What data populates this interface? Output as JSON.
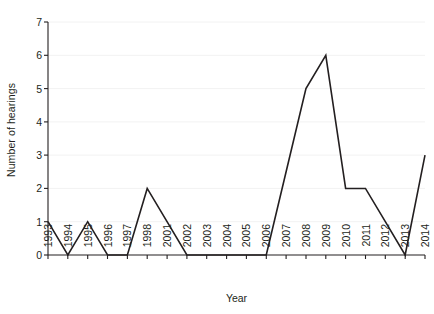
{
  "chart_data": {
    "type": "line",
    "title": "",
    "xlabel": "Year",
    "ylabel": "Number of hearings",
    "categories": [
      "1993",
      "1994",
      "1995",
      "1996",
      "1997",
      "1998",
      "2001",
      "2002",
      "2003",
      "2004",
      "2005",
      "2006",
      "2007",
      "2008",
      "2009",
      "2010",
      "2011",
      "2012",
      "2013",
      "2014"
    ],
    "values": [
      1,
      0,
      1,
      0,
      0,
      2,
      1,
      0,
      0,
      0,
      0,
      0,
      2.5,
      5,
      6,
      2,
      2,
      1,
      0,
      3
    ],
    "series": [
      {
        "name": "Number of hearings",
        "color": "#231f20",
        "values": [
          1,
          0,
          1,
          0,
          0,
          2,
          1,
          0,
          0,
          0,
          0,
          0,
          2.5,
          5,
          6,
          2,
          2,
          1,
          0,
          3
        ]
      }
    ],
    "ylim": [
      0,
      7
    ],
    "yticks": [
      0,
      1,
      2,
      3,
      4,
      5,
      6,
      7
    ],
    "ytick_labels": [
      "0",
      "1",
      "2",
      "3",
      "4",
      "5",
      "6",
      "7"
    ],
    "grid": true,
    "grid_color": "#f2f2f2",
    "legend": "none",
    "axis_color": "#231f20",
    "background": "#ffffff",
    "note": "Year axis skips 1999 and 2000; values at 2001, 2007 and 2012 lie on straight interpolated segments."
  }
}
